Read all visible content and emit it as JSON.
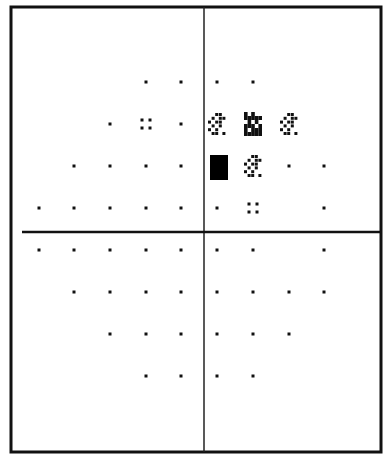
{
  "chart_data": {
    "type": "heatmap",
    "title": "",
    "xlabel": "",
    "ylabel": "",
    "grid": false,
    "legend": null,
    "columns_x": [
      39,
      74,
      110,
      146,
      181,
      217,
      253,
      289,
      324
    ],
    "rows_y": [
      82,
      124,
      166,
      208,
      250,
      292,
      334,
      376
    ],
    "symbol_legend": {
      "dot": "normal",
      "four-dots": "p<5%",
      "checker": "p<2%",
      "dense-checker": "p<1%",
      "solid": "p<0.5%"
    },
    "points": [
      {
        "row": 0,
        "col": 3,
        "symbol": "dot"
      },
      {
        "row": 0,
        "col": 4,
        "symbol": "dot"
      },
      {
        "row": 0,
        "col": 5,
        "symbol": "dot"
      },
      {
        "row": 0,
        "col": 6,
        "symbol": "dot"
      },
      {
        "row": 1,
        "col": 2,
        "symbol": "dot"
      },
      {
        "row": 1,
        "col": 3,
        "symbol": "four-dots"
      },
      {
        "row": 1,
        "col": 4,
        "symbol": "dot"
      },
      {
        "row": 1,
        "col": 5,
        "symbol": "checker"
      },
      {
        "row": 1,
        "col": 6,
        "symbol": "dense-checker"
      },
      {
        "row": 1,
        "col": 7,
        "symbol": "checker"
      },
      {
        "row": 2,
        "col": 1,
        "symbol": "dot"
      },
      {
        "row": 2,
        "col": 2,
        "symbol": "dot"
      },
      {
        "row": 2,
        "col": 3,
        "symbol": "dot"
      },
      {
        "row": 2,
        "col": 4,
        "symbol": "dot"
      },
      {
        "row": 2,
        "col": 5,
        "symbol": "solid"
      },
      {
        "row": 2,
        "col": 6,
        "symbol": "checker"
      },
      {
        "row": 2,
        "col": 7,
        "symbol": "dot"
      },
      {
        "row": 2,
        "col": 8,
        "symbol": "dot"
      },
      {
        "row": 3,
        "col": 0,
        "symbol": "dot"
      },
      {
        "row": 3,
        "col": 1,
        "symbol": "dot"
      },
      {
        "row": 3,
        "col": 2,
        "symbol": "dot"
      },
      {
        "row": 3,
        "col": 3,
        "symbol": "dot"
      },
      {
        "row": 3,
        "col": 4,
        "symbol": "dot"
      },
      {
        "row": 3,
        "col": 5,
        "symbol": "dot"
      },
      {
        "row": 3,
        "col": 6,
        "symbol": "four-dots"
      },
      {
        "row": 3,
        "col": 8,
        "symbol": "dot"
      },
      {
        "row": 4,
        "col": 0,
        "symbol": "dot"
      },
      {
        "row": 4,
        "col": 1,
        "symbol": "dot"
      },
      {
        "row": 4,
        "col": 2,
        "symbol": "dot"
      },
      {
        "row": 4,
        "col": 3,
        "symbol": "dot"
      },
      {
        "row": 4,
        "col": 4,
        "symbol": "dot"
      },
      {
        "row": 4,
        "col": 5,
        "symbol": "dot"
      },
      {
        "row": 4,
        "col": 6,
        "symbol": "dot"
      },
      {
        "row": 4,
        "col": 8,
        "symbol": "dot"
      },
      {
        "row": 5,
        "col": 1,
        "symbol": "dot"
      },
      {
        "row": 5,
        "col": 2,
        "symbol": "dot"
      },
      {
        "row": 5,
        "col": 3,
        "symbol": "dot"
      },
      {
        "row": 5,
        "col": 4,
        "symbol": "dot"
      },
      {
        "row": 5,
        "col": 5,
        "symbol": "dot"
      },
      {
        "row": 5,
        "col": 6,
        "symbol": "dot"
      },
      {
        "row": 5,
        "col": 7,
        "symbol": "dot"
      },
      {
        "row": 5,
        "col": 8,
        "symbol": "dot"
      },
      {
        "row": 6,
        "col": 2,
        "symbol": "dot"
      },
      {
        "row": 6,
        "col": 3,
        "symbol": "dot"
      },
      {
        "row": 6,
        "col": 4,
        "symbol": "dot"
      },
      {
        "row": 6,
        "col": 5,
        "symbol": "dot"
      },
      {
        "row": 6,
        "col": 6,
        "symbol": "dot"
      },
      {
        "row": 6,
        "col": 7,
        "symbol": "dot"
      },
      {
        "row": 7,
        "col": 3,
        "symbol": "dot"
      },
      {
        "row": 7,
        "col": 4,
        "symbol": "dot"
      },
      {
        "row": 7,
        "col": 5,
        "symbol": "dot"
      },
      {
        "row": 7,
        "col": 6,
        "symbol": "dot"
      }
    ]
  },
  "frame": {
    "left": 11,
    "top": 7,
    "right": 381,
    "bottom": 452,
    "vertical_axis_x": 204,
    "horizontal_axis_y": 232,
    "horizontal_axis_x_start": 22,
    "line_color": "#111111"
  }
}
